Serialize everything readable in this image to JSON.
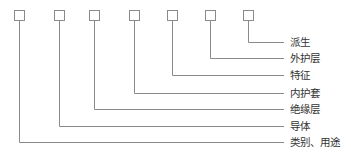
{
  "diagram": {
    "type": "cable-model-code-structure",
    "boxes": [
      {
        "id": 1,
        "x": 14,
        "label": "类别、用途",
        "label_y": 142
      },
      {
        "id": 2,
        "x": 54,
        "label": "导体",
        "label_y": 126
      },
      {
        "id": 3,
        "x": 89,
        "label": "绝缘层",
        "label_y": 109
      },
      {
        "id": 4,
        "x": 129,
        "label": "内护套",
        "label_y": 93
      },
      {
        "id": 5,
        "x": 167,
        "label": "特征",
        "label_y": 75
      },
      {
        "id": 6,
        "x": 205,
        "label": "外护层",
        "label_y": 58
      },
      {
        "id": 7,
        "x": 243,
        "label": "派生",
        "label_y": 42
      }
    ],
    "labels": {
      "l1": "类别、用途",
      "l2": "导体",
      "l3": "绝缘层",
      "l4": "内护套",
      "l5": "特征",
      "l6": "外护层",
      "l7": "派生"
    },
    "colors": {
      "line": "#8a8a8a",
      "text": "#333333"
    }
  }
}
